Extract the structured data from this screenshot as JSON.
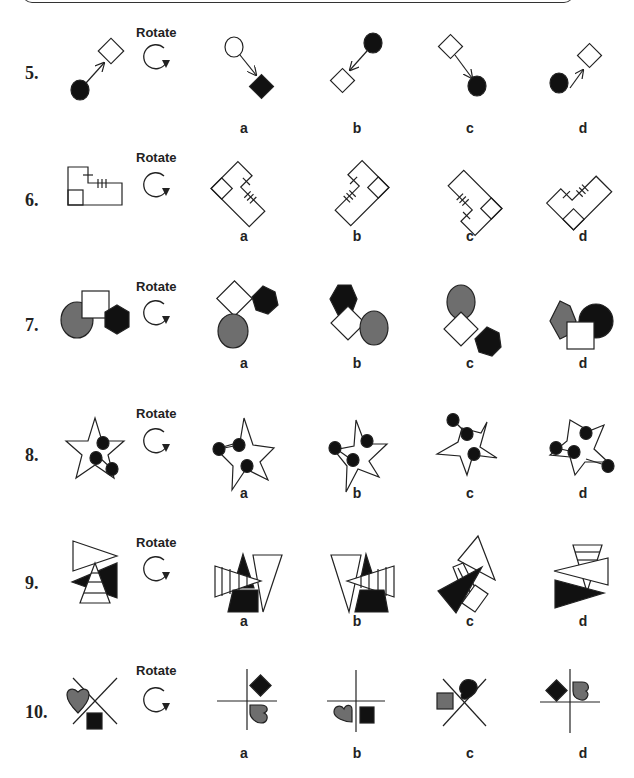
{
  "instruction_box": {
    "visible_part": "bottom edge of rounded instruction box"
  },
  "colors": {
    "black": "#111111",
    "grey": "#6e6e6e",
    "stroke": "#222222",
    "background": "#ffffff"
  },
  "rotate_label": "Rotate",
  "rotate_icon": "clockwise-arrow-icon",
  "questions": [
    {
      "number": "5.",
      "rotate_label": "Rotate",
      "options": [
        {
          "label": "a"
        },
        {
          "label": "b"
        },
        {
          "label": "c"
        },
        {
          "label": "d"
        }
      ]
    },
    {
      "number": "6.",
      "rotate_label": "Rotate",
      "options": [
        {
          "label": "a"
        },
        {
          "label": "b"
        },
        {
          "label": "c"
        },
        {
          "label": "d"
        }
      ]
    },
    {
      "number": "7.",
      "rotate_label": "Rotate",
      "options": [
        {
          "label": "a"
        },
        {
          "label": "b"
        },
        {
          "label": "c"
        },
        {
          "label": "d"
        }
      ]
    },
    {
      "number": "8.",
      "rotate_label": "Rotate",
      "options": [
        {
          "label": "a"
        },
        {
          "label": "b"
        },
        {
          "label": "c"
        },
        {
          "label": "d"
        }
      ]
    },
    {
      "number": "9.",
      "rotate_label": "Rotate",
      "options": [
        {
          "label": "a"
        },
        {
          "label": "b"
        },
        {
          "label": "c"
        },
        {
          "label": "d"
        }
      ]
    },
    {
      "number": "10.",
      "rotate_label": "Rotate",
      "options": [
        {
          "label": "a"
        },
        {
          "label": "b"
        },
        {
          "label": "c"
        },
        {
          "label": "d"
        }
      ]
    }
  ]
}
